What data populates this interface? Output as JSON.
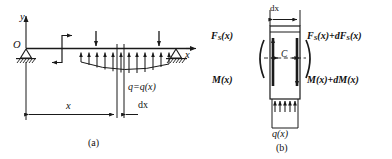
{
  "figure": {
    "stroke_color": "#1a1a1a",
    "background": "#ffffff"
  },
  "panel_a": {
    "caption": "(a)",
    "axis_y_label": "y",
    "axis_x_label": "x",
    "origin_label": "O",
    "load_label": "q=q(x)",
    "dimension_x_label": "x",
    "dimension_dx_label": "dx",
    "supports": [
      "pin-support-left",
      "roller-support-right"
    ],
    "point_loads_count": 2,
    "distributed_arrows_count": 11,
    "distributed_direction": "upward",
    "point_load_direction": "downward"
  },
  "panel_b": {
    "caption": "(b)",
    "width_label": "dx",
    "centroid_label": "C",
    "shear_left_label": "F",
    "shear_left_sub": "S",
    "shear_left_arg": "(x)",
    "shear_right_label": "F",
    "shear_right_sub": "S",
    "shear_right_arg": "(x)+dF",
    "shear_right_sub2": "S",
    "shear_right_arg2": "(x)",
    "moment_left_label": "M(x)",
    "moment_right_label": "M(x)+dM(x)",
    "load_label": "q(x)",
    "bottom_arrows_count": 4,
    "bottom_arrow_direction": "upward"
  }
}
